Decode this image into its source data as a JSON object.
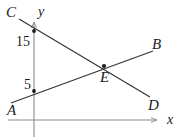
{
  "figure": {
    "kind": "coordinate-geometry-diagram",
    "width": 178,
    "height": 137,
    "background_color": "#ffffff",
    "line_color": "#333333",
    "axis_color": "#8a8a8a",
    "text_color": "#1a1a1a"
  },
  "axes": {
    "x_axis": {
      "label": "x",
      "label_x": 167,
      "label_y": 113,
      "start_x": 8,
      "end_x": 157,
      "y": 120,
      "arrow": "right"
    },
    "y_axis": {
      "label": "y",
      "label_x": 38,
      "label_y": 5,
      "x": 34,
      "start_y": 137,
      "end_y": 22,
      "arrow": "up"
    }
  },
  "tick_labels": [
    {
      "text": "15",
      "x": 16,
      "y": 35,
      "marks_point": "C-line y-intercept"
    },
    {
      "text": "5",
      "x": 24,
      "y": 78,
      "marks_point": "A-line y-intercept"
    }
  ],
  "lines": [
    {
      "name": "line-AB",
      "from_label": "A",
      "to_label": "B",
      "x1": 11,
      "y1": 103,
      "x2": 153,
      "y2": 51,
      "y_intercept_value": 5,
      "slope_sign": "positive"
    },
    {
      "name": "line-CD",
      "from_label": "C",
      "to_label": "D",
      "x1": 19,
      "y1": 19,
      "x2": 150,
      "y2": 97,
      "y_intercept_value": 15,
      "slope_sign": "negative"
    }
  ],
  "points": [
    {
      "label": "A",
      "label_x": 7,
      "label_y": 103,
      "dot": false
    },
    {
      "label": "B",
      "label_x": 152,
      "label_y": 37,
      "dot": false
    },
    {
      "label": "C",
      "label_x": 6,
      "label_y": 5,
      "dot": false
    },
    {
      "label": "D",
      "label_x": 148,
      "label_y": 98,
      "dot": false
    },
    {
      "label": "E",
      "label_x": 100,
      "label_y": 70,
      "dot": true,
      "dot_x": 104,
      "dot_y": 66,
      "role": "intersection"
    }
  ],
  "marked_dots": [
    {
      "name": "dot-y-15",
      "x": 34,
      "y": 31,
      "value": 15
    },
    {
      "name": "dot-y-5",
      "x": 34,
      "y": 91,
      "value": 5
    },
    {
      "name": "dot-intersection-E",
      "x": 104,
      "y": 66,
      "value": null
    }
  ]
}
